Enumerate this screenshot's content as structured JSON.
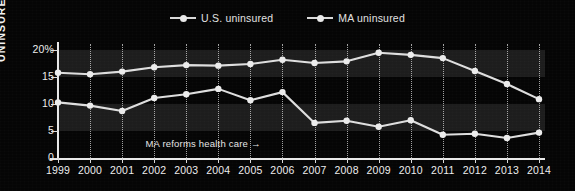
{
  "legend": {
    "position": "top-center",
    "items": [
      {
        "label": "U.S. uninsured",
        "key": "us",
        "marker": "line-dot-marker",
        "color": "#dedede"
      },
      {
        "label": "MA uninsured",
        "key": "ma",
        "marker": "line-dot-marker",
        "color": "#dedede"
      }
    ]
  },
  "axis": {
    "y_title": "UNINSURED",
    "y_ticks": [
      "20%",
      "15",
      "10",
      "5",
      "0"
    ],
    "y_tick_values": [
      20,
      15,
      10,
      5,
      0
    ],
    "ylim": [
      0,
      20
    ],
    "x_title": ""
  },
  "annotation": {
    "text": "MA reforms health care →",
    "at_year": 2006
  },
  "chart_data": {
    "type": "line",
    "title": "",
    "subtitle": "",
    "xlabel": "",
    "ylabel": "UNINSURED",
    "ylim": [
      0,
      20
    ],
    "xlim": [
      1999,
      2014
    ],
    "grid": "vertical-dotted",
    "legend_position": "top-center",
    "units": "percent",
    "categories": [
      1999,
      2000,
      2001,
      2002,
      2003,
      2004,
      2005,
      2006,
      2007,
      2008,
      2009,
      2010,
      2011,
      2012,
      2013,
      2014
    ],
    "series": [
      {
        "name": "U.S. uninsured",
        "color": "#dedede",
        "values": [
          15.8,
          15.5,
          16.0,
          16.8,
          17.2,
          17.1,
          17.4,
          18.2,
          17.6,
          17.9,
          19.5,
          19.1,
          18.5,
          16.1,
          13.7,
          10.9
        ]
      },
      {
        "name": "MA uninsured",
        "color": "#dedede",
        "values": [
          10.3,
          9.7,
          8.7,
          11.1,
          11.8,
          12.8,
          10.7,
          12.2,
          6.5,
          6.9,
          5.8,
          7.0,
          4.3,
          4.5,
          3.7,
          4.7
        ]
      }
    ],
    "annotations": [
      {
        "text": "MA reforms health care →",
        "at_year": 2006
      }
    ]
  },
  "style": {
    "background": "#050505",
    "band_color": "#1d1d1d",
    "axis_color": "#e9e9e9",
    "grid_color": "#cfcfcf",
    "text_color": "#ededed"
  }
}
